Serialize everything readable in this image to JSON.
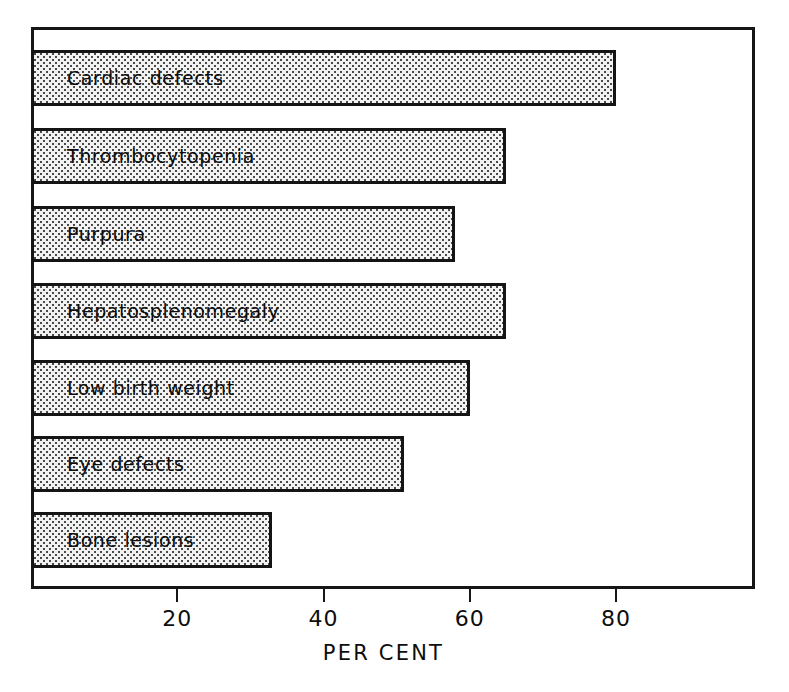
{
  "chart_data": {
    "type": "bar",
    "orientation": "horizontal",
    "title": "",
    "xlabel": "PER CENT",
    "ylabel": "",
    "xlim": [
      0,
      99
    ],
    "xticks": [
      20,
      40,
      60,
      80
    ],
    "xtick_labels": [
      "20",
      "40",
      "60",
      "80"
    ],
    "grid": false,
    "legend": null,
    "categories": [
      "Cardiac defects",
      "Thrombocytopenia",
      "Purpura",
      "Hepatosplenomegaly",
      "Low birth weight",
      "Eye defects",
      "Bone lesions"
    ],
    "values": [
      80,
      65,
      58,
      65,
      60,
      51,
      33
    ],
    "bar_fill": "#f2f2f2",
    "bar_pattern": "stipple-dots",
    "bar_edge_color": "#141414",
    "frame_color": "#161616",
    "background": "#ffffff"
  },
  "axis": {
    "title": "PER CENT",
    "ticks": [
      {
        "value": 20,
        "label": "20"
      },
      {
        "value": 40,
        "label": "40"
      },
      {
        "value": 60,
        "label": "60"
      },
      {
        "value": 80,
        "label": "80"
      }
    ]
  },
  "bars": [
    {
      "label": "Cardiac defects",
      "value": 80
    },
    {
      "label": "Thrombocytopenia",
      "value": 65
    },
    {
      "label": "Purpura",
      "value": 58
    },
    {
      "label": "Hepatosplenomegaly",
      "value": 65
    },
    {
      "label": "Low birth weight",
      "value": 60
    },
    {
      "label": "Eye defects",
      "value": 51
    },
    {
      "label": "Bone lesions",
      "value": 33
    }
  ]
}
